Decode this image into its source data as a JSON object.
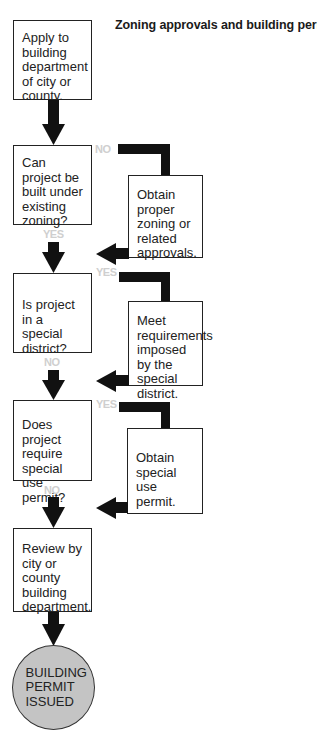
{
  "title": "Zoning approvals and building permits.",
  "steps": [
    {
      "id": "apply",
      "text": "Apply to building department of city or county."
    },
    {
      "id": "zoning-question",
      "text": "Can project be built under existing zoning?"
    },
    {
      "id": "special-district-question",
      "text": "Is project in a special district?"
    },
    {
      "id": "special-use-question",
      "text": "Does project require special use permit?"
    },
    {
      "id": "review",
      "text": "Review by city or county building department."
    }
  ],
  "side_actions": [
    {
      "branch_label": "NO",
      "text": "Obtain proper zoning or related approvals.",
      "main_label": "YES"
    },
    {
      "branch_label": "YES",
      "text": "Meet requirements imposed by the special district.",
      "main_label": "NO"
    },
    {
      "branch_label": "YES",
      "text": "Obtain special use permit.",
      "main_label": "NO"
    }
  ],
  "result": {
    "text": "BUILDING PERMIT ISSUED"
  },
  "colors": {
    "arrow": "#111111",
    "label": "#cfcfcf",
    "circle_fill": "#c4c4c4"
  }
}
